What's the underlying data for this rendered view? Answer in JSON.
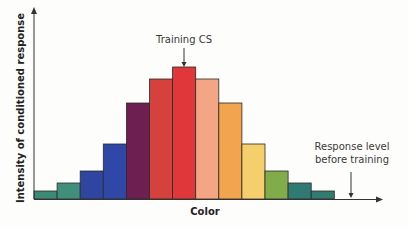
{
  "chart_data": {
    "type": "bar",
    "title": "",
    "xlabel": "Color",
    "ylabel": "Intensity of conditioned response",
    "categories": [
      "c1",
      "c2",
      "c3",
      "c4",
      "c5",
      "c6",
      "c7",
      "c8",
      "c9",
      "c10",
      "c11",
      "c12",
      "c13"
    ],
    "values": [
      8,
      16,
      28,
      55,
      96,
      120,
      132,
      120,
      96,
      55,
      28,
      16,
      8
    ],
    "colors": [
      "#3c8a76",
      "#3f8f7a",
      "#2f45a0",
      "#2f48a8",
      "#6e1f52",
      "#d5413c",
      "#e0373a",
      "#f4a583",
      "#f2a44e",
      "#f5cf6c",
      "#80ac4a",
      "#2f7a72",
      "#337a70"
    ],
    "ylim": [
      0,
      140
    ],
    "grid": false,
    "legend": null,
    "annotations": [
      {
        "text": "Training CS",
        "target": "c7",
        "type": "arrow-down"
      },
      {
        "text": "Response level before training",
        "lines": [
          "Response level",
          "before training"
        ],
        "type": "arrow-down-to-baseline"
      }
    ]
  },
  "labels": {
    "x_axis": "Color",
    "y_axis": "Intensity of conditioned response",
    "training_cs": "Training CS",
    "response_line1": "Response level",
    "response_line2": "before training"
  }
}
